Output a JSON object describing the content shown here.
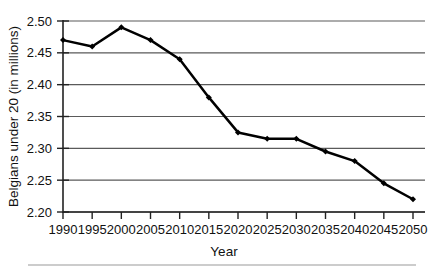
{
  "chart_data": {
    "type": "line",
    "title": "",
    "xlabel": "Year",
    "ylabel": "Belgians under 20 (in millions)",
    "categories": [
      1990,
      1995,
      2000,
      2005,
      2010,
      2015,
      2020,
      2025,
      2030,
      2035,
      2040,
      2045,
      2050
    ],
    "x_tick_labels": [
      "1990",
      "1995",
      "2000",
      "2005",
      "2010",
      "2015",
      "2020",
      "2025",
      "2030",
      "2035",
      "2040",
      "2045",
      "2050"
    ],
    "values": [
      2.47,
      2.46,
      2.49,
      2.47,
      2.44,
      2.38,
      2.325,
      2.315,
      2.315,
      2.295,
      2.28,
      2.245,
      2.22
    ],
    "y_tick_labels": [
      "2.20",
      "2.25",
      "2.30",
      "2.35",
      "2.40",
      "2.45",
      "2.50"
    ],
    "y_ticks": [
      2.2,
      2.25,
      2.3,
      2.35,
      2.4,
      2.45,
      2.5
    ],
    "ylim": [
      2.2,
      2.5
    ],
    "xlim": [
      1990,
      2050
    ],
    "grid": "horizontal",
    "legend": "none",
    "marker": "filled-diamond",
    "line_color": "#000000",
    "grid_color": "#5a5a5a"
  }
}
